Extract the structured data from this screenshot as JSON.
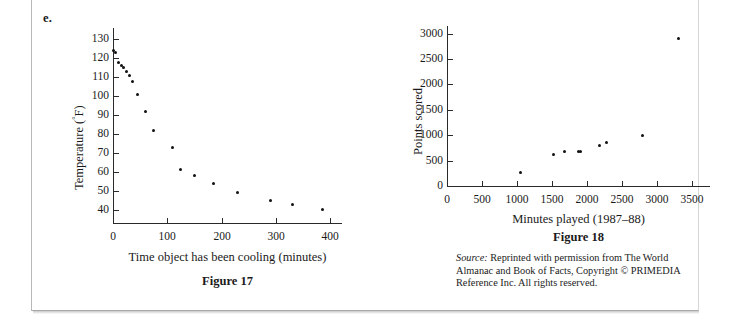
{
  "page": {
    "item_letter": "e."
  },
  "source_note": {
    "label": "Source:",
    "text": "Reprinted with permission from The World Almanac and Book of Facts, Copyright © PRIMEDIA Reference Inc. All rights reserved."
  },
  "chart_data": [
    {
      "id": "figure-17",
      "type": "scatter",
      "title": "Figure 17",
      "xlabel": "Time object has been cooling (minutes)",
      "ylabel": "Temperature (°F)",
      "xlim": [
        0,
        420
      ],
      "ylim": [
        33,
        136
      ],
      "xticks": [
        0,
        100,
        200,
        300,
        400
      ],
      "yticks": [
        40,
        50,
        60,
        70,
        80,
        90,
        100,
        110,
        120,
        130
      ],
      "grid": false,
      "legend": null,
      "x": [
        0,
        5,
        10,
        15,
        20,
        25,
        30,
        35,
        45,
        60,
        75,
        110,
        125,
        150,
        185,
        230,
        290,
        330,
        385
      ],
      "y": [
        124,
        123,
        118,
        116,
        115,
        113,
        111,
        108,
        101,
        92,
        82,
        73,
        61,
        58,
        54,
        49,
        45,
        43,
        40
      ],
      "points": [
        {
          "x": 0,
          "y": 124
        },
        {
          "x": 5,
          "y": 123
        },
        {
          "x": 10,
          "y": 118
        },
        {
          "x": 15,
          "y": 116
        },
        {
          "x": 20,
          "y": 115
        },
        {
          "x": 25,
          "y": 113
        },
        {
          "x": 30,
          "y": 111
        },
        {
          "x": 35,
          "y": 108
        },
        {
          "x": 45,
          "y": 101
        },
        {
          "x": 60,
          "y": 92
        },
        {
          "x": 75,
          "y": 82
        },
        {
          "x": 110,
          "y": 73
        },
        {
          "x": 125,
          "y": 61
        },
        {
          "x": 150,
          "y": 58
        },
        {
          "x": 185,
          "y": 54
        },
        {
          "x": 230,
          "y": 49
        },
        {
          "x": 290,
          "y": 45
        },
        {
          "x": 330,
          "y": 43
        },
        {
          "x": 385,
          "y": 40
        }
      ]
    },
    {
      "id": "figure-18",
      "type": "scatter",
      "title": "Figure 18",
      "xlabel": "Minutes played (1987–88)",
      "ylabel": "Points scored",
      "xlim": [
        0,
        3750
      ],
      "ylim": [
        0,
        3150
      ],
      "xticks": [
        0,
        500,
        1000,
        1500,
        2000,
        2500,
        3000,
        3500
      ],
      "yticks": [
        0,
        500,
        1000,
        1500,
        2000,
        2500,
        3000
      ],
      "grid": false,
      "legend": null,
      "x": [
        1050,
        1520,
        1680,
        1880,
        1910,
        2180,
        2280,
        2800,
        3320
      ],
      "y": [
        270,
        620,
        670,
        670,
        680,
        800,
        850,
        1000,
        2900
      ],
      "points": [
        {
          "x": 1050,
          "y": 270
        },
        {
          "x": 1520,
          "y": 620
        },
        {
          "x": 1680,
          "y": 670
        },
        {
          "x": 1880,
          "y": 670
        },
        {
          "x": 1910,
          "y": 680
        },
        {
          "x": 2180,
          "y": 800
        },
        {
          "x": 2280,
          "y": 850
        },
        {
          "x": 2800,
          "y": 1000
        },
        {
          "x": 3320,
          "y": 2900
        }
      ]
    }
  ],
  "figure17": {
    "xtick_labels": [
      "0",
      "100",
      "200",
      "300",
      "400"
    ],
    "ytick_labels": [
      "40",
      "50",
      "60",
      "70",
      "80",
      "90",
      "100",
      "110",
      "120",
      "130"
    ],
    "xlabel": "Time object has been cooling (minutes)",
    "ylabel_main": "Temperature (",
    "ylabel_deg": "°",
    "ylabel_tail": "F)",
    "caption": "Figure 17"
  },
  "figure18": {
    "xtick_labels": [
      "0",
      "500",
      "1000",
      "1500",
      "2000",
      "2500",
      "3000",
      "3500"
    ],
    "ytick_labels": [
      "0",
      "500",
      "1000",
      "1500",
      "2000",
      "2500",
      "3000"
    ],
    "xlabel": "Minutes played (1987–88)",
    "ylabel": "Points scored",
    "caption": "Figure 18"
  }
}
